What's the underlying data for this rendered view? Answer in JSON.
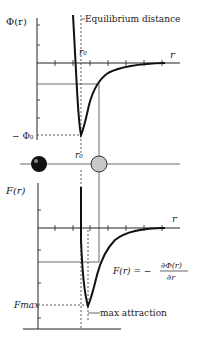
{
  "potential_plot": {
    "y_label": "Φ(r)",
    "x_label": "r",
    "r0_label": "r₀",
    "min_label": "− Φ₀",
    "annotation": "Equilibrium distance"
  },
  "atoms": {
    "r0_label": "r₀",
    "left_atom_color": "#111111",
    "right_atom_color": "#c8c8c8"
  },
  "force_plot": {
    "y_label": "F(r)",
    "x_label": "r",
    "min_label": "Fmax",
    "annotation": "max attraction",
    "equation_lhs": "F(r)  =  −",
    "equation_num": "∂Φ(r)",
    "equation_den": "∂r"
  }
}
